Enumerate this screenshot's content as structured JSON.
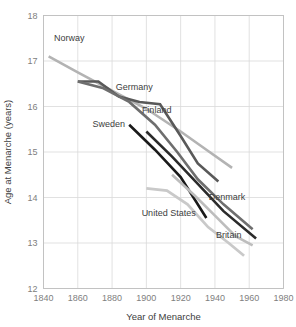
{
  "chart_data": {
    "type": "line",
    "title": "",
    "xlabel": "Year of Menarche",
    "ylabel": "Age at Menarche (years)",
    "xlim": [
      1840,
      1980
    ],
    "ylim": [
      12,
      18
    ],
    "xticks": [
      "1840",
      "1860",
      "1880",
      "1900",
      "1920",
      "1940",
      "1960",
      "1980"
    ],
    "yticks": [
      "12",
      "13",
      "14",
      "15",
      "16",
      "17",
      "18"
    ],
    "grid": true,
    "legend": "inline-labels",
    "series": [
      {
        "name": "Norway",
        "color": "#b3b3b3",
        "width": 2.6,
        "label_x": 1855,
        "label_y": 17.45,
        "x": [
          1843,
          1860,
          1880,
          1900,
          1920,
          1935,
          1950
        ],
        "y": [
          17.1,
          16.75,
          16.35,
          15.95,
          15.45,
          15.05,
          14.65
        ]
      },
      {
        "name": "Germany",
        "color": "#595959",
        "width": 2.6,
        "label_x": 1893,
        "label_y": 16.37,
        "x": [
          1860,
          1872,
          1884,
          1896,
          1908,
          1920,
          1930,
          1942
        ],
        "y": [
          16.55,
          16.55,
          16.22,
          16.1,
          16.05,
          15.35,
          14.75,
          14.35
        ]
      },
      {
        "name": "Finland",
        "color": "#6e6e6e",
        "width": 2.6,
        "label_x": 1906,
        "label_y": 15.85,
        "x": [
          1860,
          1875,
          1890,
          1905,
          1918,
          1930,
          1945,
          1962
        ],
        "y": [
          16.55,
          16.4,
          16.1,
          15.6,
          15.0,
          14.4,
          13.85,
          13.3
        ]
      },
      {
        "name": "Sweden",
        "color": "#1a1a1a",
        "width": 2.6,
        "label_x": 1878,
        "label_y": 15.55,
        "x": [
          1890,
          1905,
          1920,
          1935
        ],
        "y": [
          15.6,
          15.05,
          14.45,
          13.55
        ]
      },
      {
        "name": "Denmark",
        "color": "#2b2b2b",
        "width": 2.6,
        "label_x": 1947,
        "label_y": 13.95,
        "x": [
          1900,
          1915,
          1930,
          1945,
          1964
        ],
        "y": [
          15.45,
          14.9,
          14.3,
          13.7,
          13.1
        ]
      },
      {
        "name": "United States",
        "color": "#c9c9c9",
        "width": 2.8,
        "label_x": 1913,
        "label_y": 13.6,
        "x": [
          1900,
          1912,
          1924,
          1936,
          1948,
          1957
        ],
        "y": [
          14.2,
          14.15,
          13.85,
          13.35,
          13.0,
          12.72
        ]
      },
      {
        "name": "Britain",
        "color": "#bdbdbd",
        "width": 2.6,
        "label_x": 1948,
        "label_y": 13.1,
        "x": [
          1915,
          1928,
          1940,
          1952,
          1962
        ],
        "y": [
          14.5,
          14.05,
          13.6,
          13.15,
          12.95
        ]
      }
    ]
  }
}
